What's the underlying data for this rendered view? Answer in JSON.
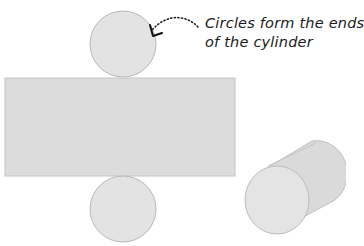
{
  "annotation": {
    "line1": "Circles form the ends",
    "line2": "of the cylinder"
  },
  "colors": {
    "fill": "#dcdcdc",
    "circle_fill": "#e3e3e3",
    "stroke": "#b5b5b5",
    "arrow": "#1a1a1a"
  },
  "shapes": {
    "net_rectangle": "rectangle",
    "top_circle": "circle",
    "bottom_circle": "circle",
    "cylinder": "3d-cylinder"
  }
}
